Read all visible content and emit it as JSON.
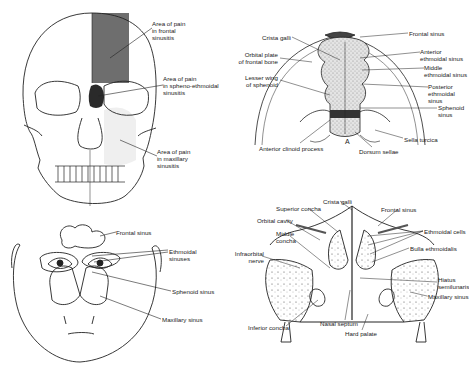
{
  "panels": {
    "skull": {
      "labels": [
        {
          "id": "frontal",
          "text": "Area of pain\nin frontal\nsinusitis",
          "x": 152,
          "y": 20
        },
        {
          "id": "spheno",
          "text": "Area of pain\nin spheno-ethmoidal\nsinusitis",
          "x": 163,
          "y": 75
        },
        {
          "id": "maxillary",
          "text": "Area of pain\nin maxillary\nsinusitis",
          "x": 157,
          "y": 148
        }
      ],
      "colors": {
        "frontal_shade": "#6e6e6e",
        "spheno_shade": "#2a2a2a",
        "maxillary_shade": "#efefef"
      }
    },
    "cranial_floor": {
      "labels": [
        {
          "id": "crista-galli",
          "text": "Crista galli",
          "x": 262,
          "y": 34
        },
        {
          "id": "orbital-plate",
          "text": "Orbital plate\nof frontal bone",
          "x": 244,
          "y": 51
        },
        {
          "id": "lesser-wing",
          "text": "Lesser wing\nof sphenoid",
          "x": 244,
          "y": 74
        },
        {
          "id": "frontal-sinus",
          "text": "Frontal sinus",
          "x": 409,
          "y": 30
        },
        {
          "id": "anterior-ethmoidal",
          "text": "Anterior\nethmoidal sinus",
          "x": 420,
          "y": 48
        },
        {
          "id": "middle-ethmoidal",
          "text": "Middle\nethmoidal sinus",
          "x": 424,
          "y": 64
        },
        {
          "id": "posterior-ethmoidal",
          "text": "Posterior\nethmoidal sinus",
          "x": 428,
          "y": 83
        },
        {
          "id": "sphenoid-sinus",
          "text": "Sphenoid\nsinus",
          "x": 438,
          "y": 104
        },
        {
          "id": "sella-turcica",
          "text": "Sella turcica",
          "x": 404,
          "y": 136
        },
        {
          "id": "anterior-clinoid",
          "text": "Anterior clinoid process",
          "x": 259,
          "y": 145
        },
        {
          "id": "dorsum-sellae",
          "text": "Dorsum sellae",
          "x": 359,
          "y": 148
        },
        {
          "id": "marker-a",
          "text": "A",
          "x": 345,
          "y": 138
        }
      ]
    },
    "face": {
      "labels": [
        {
          "id": "frontal-sinus",
          "text": "Frontal sinus",
          "x": 116,
          "y": 229
        },
        {
          "id": "ethmoidal-sinuses",
          "text": "Ethmoidal\nsinuses",
          "x": 169,
          "y": 248
        },
        {
          "id": "sphenoid-sinus",
          "text": "Sphenoid sinus",
          "x": 172,
          "y": 288
        },
        {
          "id": "maxillary-sinus",
          "text": "Maxillary sinus",
          "x": 162,
          "y": 316
        }
      ]
    },
    "coronal_section": {
      "labels": [
        {
          "id": "crista-galli",
          "text": "Crista galli",
          "x": 323,
          "y": 198
        },
        {
          "id": "superior-concha",
          "text": "Superior concha",
          "x": 276,
          "y": 205
        },
        {
          "id": "frontal-sinus",
          "text": "Frontal sinus",
          "x": 381,
          "y": 206
        },
        {
          "id": "orbital-cavity",
          "text": "Orbital cavity",
          "x": 257,
          "y": 217
        },
        {
          "id": "ethmoidal-cells",
          "text": "Ethmoidal cells",
          "x": 424,
          "y": 228
        },
        {
          "id": "middle-concha",
          "text": "Middle\nconcha",
          "x": 276,
          "y": 230
        },
        {
          "id": "bulla-ethmoidalis",
          "text": "Bulla ethmoidalis",
          "x": 410,
          "y": 245
        },
        {
          "id": "infraorbital-nerve",
          "text": "Infraorbital\nnerve",
          "x": 240,
          "y": 250
        },
        {
          "id": "hiatus-semilunaris",
          "text": "Hiatus\nsemilunaris",
          "x": 438,
          "y": 276
        },
        {
          "id": "maxillary-sinus",
          "text": "Maxillary sinus",
          "x": 428,
          "y": 293
        },
        {
          "id": "inferior-concha",
          "text": "Inferior concha",
          "x": 248,
          "y": 324
        },
        {
          "id": "nasal-septum",
          "text": "Nasal septum",
          "x": 320,
          "y": 320
        },
        {
          "id": "hard-palate",
          "text": "Hard palate",
          "x": 345,
          "y": 330
        }
      ]
    }
  }
}
